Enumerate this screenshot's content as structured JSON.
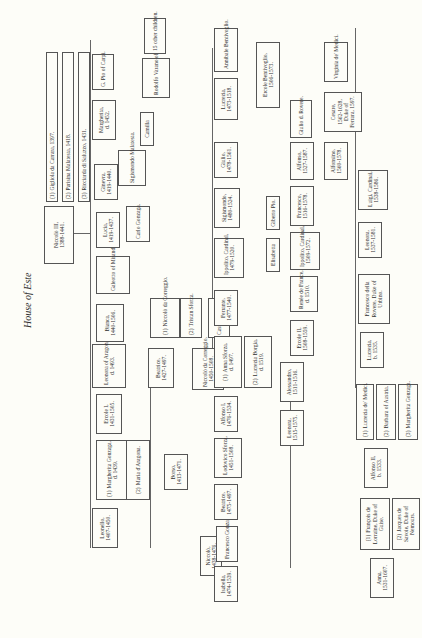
{
  "title": "House of Este",
  "people": {
    "niccolo3": {
      "name": "Niccolò III,",
      "dates": "1388-1441."
    },
    "wife1": {
      "num": "(1)",
      "name": "Gigliola da Carrara, 1397."
    },
    "wife2": {
      "num": "(2)",
      "name": "Parisina Malatesta, 1418."
    },
    "wife3": {
      "num": "(3)",
      "name": "Ricciarda di Saluzzo, 1431."
    },
    "leonello": {
      "name": "Leonello,",
      "dates": "1407-1450."
    },
    "margherita_gonzaga1": {
      "num": "(1)",
      "name": "Margherita Gonzaga,",
      "dates": "d. 1439."
    },
    "maria_aragona": {
      "num": "(2)",
      "name": "Maria d'Aragona."
    },
    "niccolo_1438": {
      "name": "Niccolò,",
      "dates": "1438-1476."
    },
    "ercole1": {
      "name": "Ercole I,",
      "dates": "1431-1505."
    },
    "leonora_aragon": {
      "name": "Leonora of Aragon,",
      "dates": "d. 1493."
    },
    "borso": {
      "name": "Borso,",
      "dates": "1413-1471."
    },
    "bianca": {
      "name": "Bianca,",
      "dates": "1440-1506."
    },
    "galeotto": {
      "name": "Galeotto of Mirandola."
    },
    "beatrice_1427": {
      "name": "Beatrice,",
      "dates": "1427-1497."
    },
    "niccolo_correggio_spouse": {
      "num": "(1)",
      "name": "Niccolò da Correggio."
    },
    "tristan_sforza": {
      "num": "(2)",
      "name": "Tristan Sforza."
    },
    "niccolo_correggio_son": {
      "name": "Niccolò da Correggio,",
      "dates": "1450-1508."
    },
    "cassandra": {
      "name": "Cassandra Colleoni."
    },
    "lucia": {
      "name": "Lucia,",
      "dates": "1419-1437."
    },
    "carlo_gonzaga": {
      "name": "Carlo Gonzaga."
    },
    "ginevra": {
      "name": "Ginevra,",
      "dates": "1419-1440."
    },
    "sigismondo_malatesta": {
      "name": "Sigismondo Malatesta."
    },
    "camilla": {
      "name": "Camilla"
    },
    "rodolfo": {
      "name": "Rodolfo Varano of Camerino."
    },
    "margherita_1452": {
      "name": "Margherita,",
      "dates": "d. 1452."
    },
    "pio_carpi": {
      "name": "G. Pio of Carpi."
    },
    "other_children": {
      "name": "15 other children."
    },
    "isabella": {
      "name": "Isabella,",
      "dates": "1474-1539."
    },
    "francesco_gonzaga": {
      "name": "Francesco Gonzaga."
    },
    "beatrice_1475": {
      "name": "Beatrice,",
      "dates": "1475-1497."
    },
    "lodovico_sforza": {
      "name": "Lodovico Sforza,",
      "dates": "1451-1508."
    },
    "alfonso1": {
      "name": "Alfonso I,",
      "dates": "1476-1534."
    },
    "anna_sforza": {
      "num": "(1)",
      "name": "Anna Sforza,",
      "dates": "d. 1497."
    },
    "lucrezia_borgia": {
      "num": "(2)",
      "name": "Lucrezia Borgia,",
      "dates": "d. 1519."
    },
    "ferrante": {
      "name": "Ferrante,",
      "dates": "1477-1540."
    },
    "ippolito1": {
      "name": "Ippolito, Cardinal,",
      "dates": "1479-1520."
    },
    "elisabetta": {
      "name": "Elisabetta"
    },
    "giberto_pio": {
      "name": "Giberto Pio."
    },
    "sigismondo_1480": {
      "name": "Sigismondo,",
      "dates": "1480-1524."
    },
    "giulio_1478": {
      "name": "Giulio,",
      "dates": "1478-1561."
    },
    "lucrezia_1473": {
      "name": "Lucrezia,",
      "dates": "1473-1518."
    },
    "annibale": {
      "name": "Annibale Bentivoglio."
    },
    "ercole_bentivoglio": {
      "name": "Ercole Bentivoglio,",
      "dates": "1506-1573."
    },
    "leonora_1515": {
      "name": "Leonora,",
      "dates": "1515-1575."
    },
    "alessandro": {
      "name": "Alessandro,",
      "dates": "1511-1516."
    },
    "ercole2": {
      "name": "Ercole II,",
      "dates": "1508-1559."
    },
    "renee": {
      "name": "Renée de France,",
      "dates": "d. 1510."
    },
    "ippolito2": {
      "name": "Ippolito, Cardinal,",
      "dates": "1509-1572."
    },
    "francesco_1516": {
      "name": "Francesco,",
      "dates": "1516-1578."
    },
    "alfonso_1527": {
      "name": "Alfonso,",
      "dates": "1527-1587."
    },
    "giulio_rovere": {
      "name": "Giulio d. Rovere."
    },
    "alfonsino": {
      "name": "Alfonsino,",
      "dates": "1560-1578."
    },
    "cesare": {
      "name": "Cesare,",
      "dates": "1562-1628, Duke of Ferrara, 1597."
    },
    "virginia": {
      "name": "Virginia de' Medici."
    },
    "anna_1531": {
      "name": "Anna,",
      "dates": "1531-1607."
    },
    "francois_lorraine": {
      "num": "(1)",
      "name": "François de Lorraine, Duke of Guise."
    },
    "jacques_savoie": {
      "num": "(2)",
      "name": "Jacques de Savoie, Duke of Nemours."
    },
    "alfonso2": {
      "name": "Alfonso II,",
      "dates": "b. 1533."
    },
    "lucrezia_medici": {
      "num": "(1)",
      "name": "Lucrezia de' Medici."
    },
    "barbara_austria": {
      "num": "(2)",
      "name": "Barbara of Austria."
    },
    "margherita_gonzaga3": {
      "num": "(3)",
      "name": "Margherita Gonzaga."
    },
    "lucrezia_1535": {
      "name": "Lucrezia,",
      "dates": "b. 1535."
    },
    "francesco_rovere": {
      "name": "Francesco della Rovere, Duke of Urbino."
    },
    "leonora_1537": {
      "name": "Leonora,",
      "dates": "1537-1581."
    },
    "luigi": {
      "name": "Luigi, Cardinal,",
      "dates": "1538-1586."
    }
  }
}
